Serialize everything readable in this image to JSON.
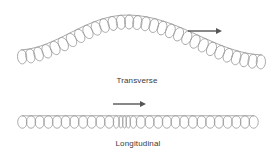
{
  "figure": {
    "title_visible": false,
    "background_color": "#ffffff",
    "coil_color": "#9a9a9a",
    "arrow_color": "#555555",
    "label_color": "#3a3a3a"
  },
  "waves": [
    {
      "id": "transverse",
      "label": "Transverse",
      "label_center_x": 137,
      "label_y": 82,
      "type": "transverse",
      "description": "coiled spring bent into a single crest",
      "start": {
        "x": 18,
        "y": 57
      },
      "end": {
        "x": 265,
        "y": 62
      },
      "crest": {
        "x": 127,
        "y": 22
      },
      "loop_count": 30,
      "loop_radius_x": 4.6,
      "loop_radius_y": 7.0,
      "arrow": {
        "label": "wave-direction-arrow",
        "x1": 188,
        "y1": 31,
        "x2": 222,
        "y2": 31,
        "direction": "right"
      }
    },
    {
      "id": "longitudinal",
      "label": "Longitudinal",
      "label_center_x": 138,
      "label_y": 145,
      "type": "longitudinal",
      "description": "coiled spring with a compression region near the middle",
      "start": {
        "x": 18,
        "y": 122
      },
      "end": {
        "x": 258,
        "y": 122
      },
      "baseline_y": 122,
      "loop_count": 30,
      "loop_radius_x": 4.6,
      "loop_radius_y": 6.2,
      "compression": {
        "start_x": 108,
        "end_x": 142,
        "factor": 0.38
      },
      "arrow": {
        "label": "wave-direction-arrow",
        "x1": 113,
        "y1": 104,
        "x2": 146,
        "y2": 104,
        "direction": "right"
      }
    }
  ]
}
